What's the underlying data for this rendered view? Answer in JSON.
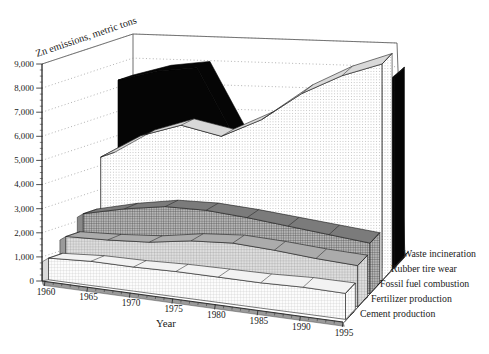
{
  "figure": {
    "y_axis_title": "Zn emissions, metric tons",
    "x_axis_title": "Year"
  },
  "axes": {
    "y_tick_labels": [
      "0",
      "1,000",
      "2,000",
      "3,000",
      "4,000",
      "5,000",
      "6,000",
      "7,000",
      "8,000",
      "9,000"
    ],
    "x_tick_labels": [
      "1960",
      "1965",
      "1970",
      "1975",
      "1980",
      "1985",
      "1990",
      "1995"
    ]
  },
  "chart_data": {
    "type": "area",
    "variant": "3d-ribbon",
    "title": "",
    "ylabel": "Zn emissions, metric tons",
    "xlabel": "Year",
    "x": [
      1960,
      1965,
      1970,
      1975,
      1980,
      1985,
      1990,
      1995
    ],
    "ylim": [
      0,
      9000
    ],
    "ytick_step": 1000,
    "yminor_step": 250,
    "gridlines": "dashed",
    "legend_position": "right",
    "series_order": "front-to-back",
    "series": [
      {
        "name": "Cement production",
        "texture": "fine-grid-light",
        "color": "#f2f2f2",
        "values": [
          900,
          1000,
          1000,
          1050,
          1050,
          1050,
          1100,
          1080
        ]
      },
      {
        "name": "Fertilizer production",
        "texture": "fine-grid-medium",
        "color": "#ababab",
        "values": [
          1550,
          1600,
          1700,
          1950,
          2050,
          1950,
          1800,
          1700
        ]
      },
      {
        "name": "Fossil fuel combustion",
        "texture": "crosshatch-dark",
        "color": "#8c8c8c",
        "values": [
          2250,
          2600,
          2850,
          2850,
          2700,
          2500,
          2300,
          2100
        ]
      },
      {
        "name": "Rubber tire wear",
        "texture": "dot-grid",
        "color": "#d9d9d9",
        "values": [
          4350,
          5350,
          5900,
          5550,
          6350,
          7550,
          8400,
          9000
        ]
      },
      {
        "name": "Waste incineration",
        "texture": "solid-black",
        "color": "#050505",
        "values": [
          7300,
          7750,
          7950,
          5000,
          4800,
          5200,
          6500,
          7900
        ]
      }
    ]
  }
}
